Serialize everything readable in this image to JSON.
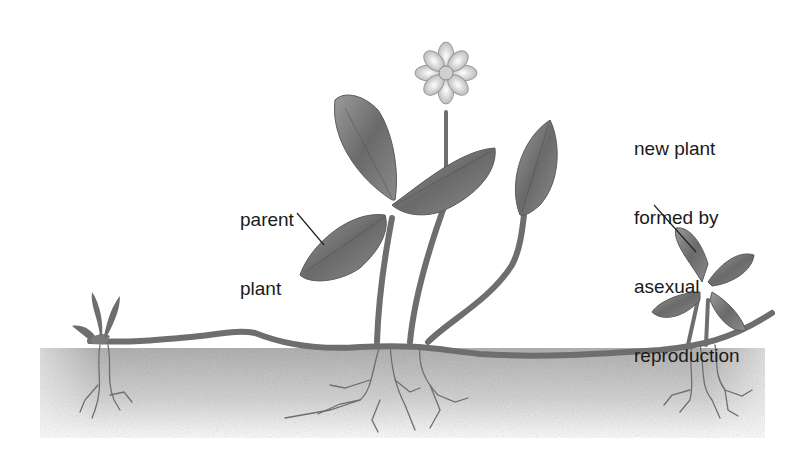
{
  "diagram": {
    "labels": {
      "parent_plant": [
        "parent",
        "plant"
      ],
      "new_plant": [
        "new plant",
        "formed by",
        "asexual",
        "reproduction"
      ]
    },
    "parts": [
      "parent-plant",
      "flower",
      "leaves",
      "runner-stem",
      "soil",
      "roots",
      "new-plant",
      "young-seedling"
    ],
    "colors": {
      "plant": "#6e6e6e",
      "plant_light": "#bdbdbd",
      "soil": "#c8c8c8",
      "text": "#1a1a1a",
      "background": "#ffffff"
    }
  }
}
